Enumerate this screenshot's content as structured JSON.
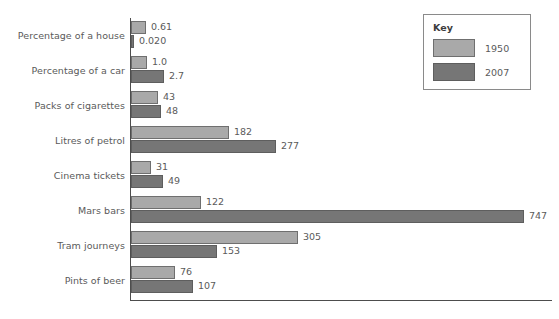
{
  "chart_data": {
    "type": "bar",
    "orientation": "horizontal",
    "title": "",
    "xlabel": "",
    "ylabel": "",
    "grid": false,
    "legend": {
      "position": "top-right",
      "title": "Key",
      "entries": [
        "1950",
        "2007"
      ]
    },
    "categories": [
      "Percentage of a house",
      "Percentage of a car",
      "Packs of cigarettes",
      "Litres of petrol",
      "Cinema tickets",
      "Mars bars",
      "Tram journeys",
      "Pints of beer"
    ],
    "series": [
      {
        "name": "1950",
        "color": "#a9a9a9",
        "values": [
          0.61,
          1.0,
          43,
          182,
          31,
          122,
          305,
          76
        ],
        "labels": [
          "0.61",
          "1.0",
          "43",
          "182",
          "31",
          "122",
          "305",
          "76"
        ],
        "bar_px": [
          15,
          16,
          27,
          98,
          20,
          70,
          167,
          44
        ]
      },
      {
        "name": "2007",
        "color": "#767676",
        "values": [
          0.02,
          2.7,
          48,
          277,
          49,
          747,
          153,
          107
        ],
        "labels": [
          "0.020",
          "2.7",
          "48",
          "277",
          "49",
          "747",
          "153",
          "107"
        ],
        "bar_px": [
          3,
          33,
          30,
          145,
          32,
          393,
          86,
          62
        ]
      }
    ]
  },
  "axes": {
    "vertical_axis_name": "category-axis",
    "horizontal_axis_name": "value-axis",
    "tick_labels": []
  }
}
